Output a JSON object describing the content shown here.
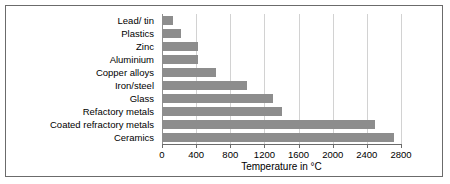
{
  "chart_data": {
    "type": "bar",
    "orientation": "horizontal",
    "title": "",
    "xlabel": "Temperature in °C",
    "ylabel": "",
    "categories": [
      "Lead/ tin",
      "Plastics",
      "Zinc",
      "Aluminium",
      "Copper alloys",
      "Iron/steel",
      "Glass",
      "Refactory metals",
      "Coated refractory metals",
      "Ceramics"
    ],
    "values": [
      130,
      220,
      420,
      420,
      630,
      1000,
      1300,
      1400,
      2500,
      2720
    ],
    "xlim": [
      0,
      2800
    ],
    "xticks": [
      0,
      400,
      800,
      1200,
      1600,
      2000,
      2400,
      2800
    ],
    "xticklabels": [
      "0",
      "400",
      "800",
      "1200",
      "1600",
      "2000",
      "2400",
      "2800"
    ],
    "grid": "vertical",
    "legend": null,
    "bar_color": "#8d8d8d",
    "grid_color": "#d2d2d2",
    "frame_color": "#6b6b6b"
  }
}
